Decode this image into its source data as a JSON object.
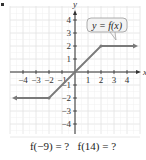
{
  "chart_data": {
    "type": "line",
    "title": "",
    "xlabel": "x",
    "ylabel": "y",
    "xlim": [
      -5,
      5
    ],
    "ylim": [
      -5,
      5
    ],
    "grid": true,
    "x_ticks": [
      "-4",
      "-3",
      "-2",
      "-1",
      "1",
      "2",
      "3",
      "4"
    ],
    "y_ticks": [
      "4",
      "3",
      "2",
      "1",
      "-1",
      "-2",
      "-3",
      "-4"
    ],
    "series": [
      {
        "name": "y = f(x)",
        "points": [
          [
            -5,
            -2
          ],
          [
            -2,
            -2
          ],
          [
            2,
            2
          ],
          [
            5,
            2
          ]
        ],
        "arrow_left": true,
        "arrow_right": true,
        "vertices": [
          [
            -2,
            -2
          ],
          [
            2,
            2
          ]
        ],
        "color": "#7a7a7a"
      }
    ],
    "annotations": [
      {
        "text": "y = f(x)",
        "type": "callout-box",
        "anchor": [
          3,
          2
        ]
      }
    ]
  },
  "caption": {
    "q1": "f(−9) = ?",
    "q2": "f(14) = ?"
  },
  "colors": {
    "grid": "#e2e2e2",
    "axis": "#333333",
    "line": "#7a7a7a",
    "label_box": "#f3f3f3"
  }
}
